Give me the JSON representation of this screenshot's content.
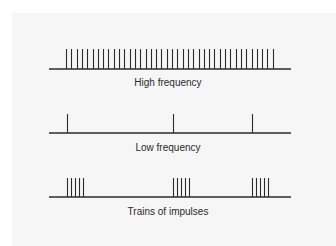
{
  "diagram": {
    "rows": [
      {
        "id": "high",
        "label": "High frequency",
        "baseline": {
          "x1": 49,
          "x2": 291,
          "y": 69
        },
        "spike_top": 49,
        "spikes": {
          "start": 66,
          "count": 40,
          "spacing": 5.3
        },
        "label_top": 77
      },
      {
        "id": "low",
        "label": "Low frequency",
        "baseline": {
          "x1": 49,
          "x2": 291,
          "y": 133
        },
        "spike_top": 114,
        "spikes_at": [
          67,
          173,
          252
        ],
        "label_top": 142
      },
      {
        "id": "trains",
        "label": "Trains of impulses",
        "baseline": {
          "x1": 49,
          "x2": 291,
          "y": 197
        },
        "spike_top": 178,
        "groups": [
          {
            "start": 67,
            "count": 5,
            "spacing": 4
          },
          {
            "start": 173,
            "count": 5,
            "spacing": 4
          },
          {
            "start": 252,
            "count": 5,
            "spacing": 4
          }
        ],
        "label_top": 206
      }
    ],
    "colors": {
      "line": "#2b2b2b",
      "panel": "#f6f6f6"
    }
  }
}
